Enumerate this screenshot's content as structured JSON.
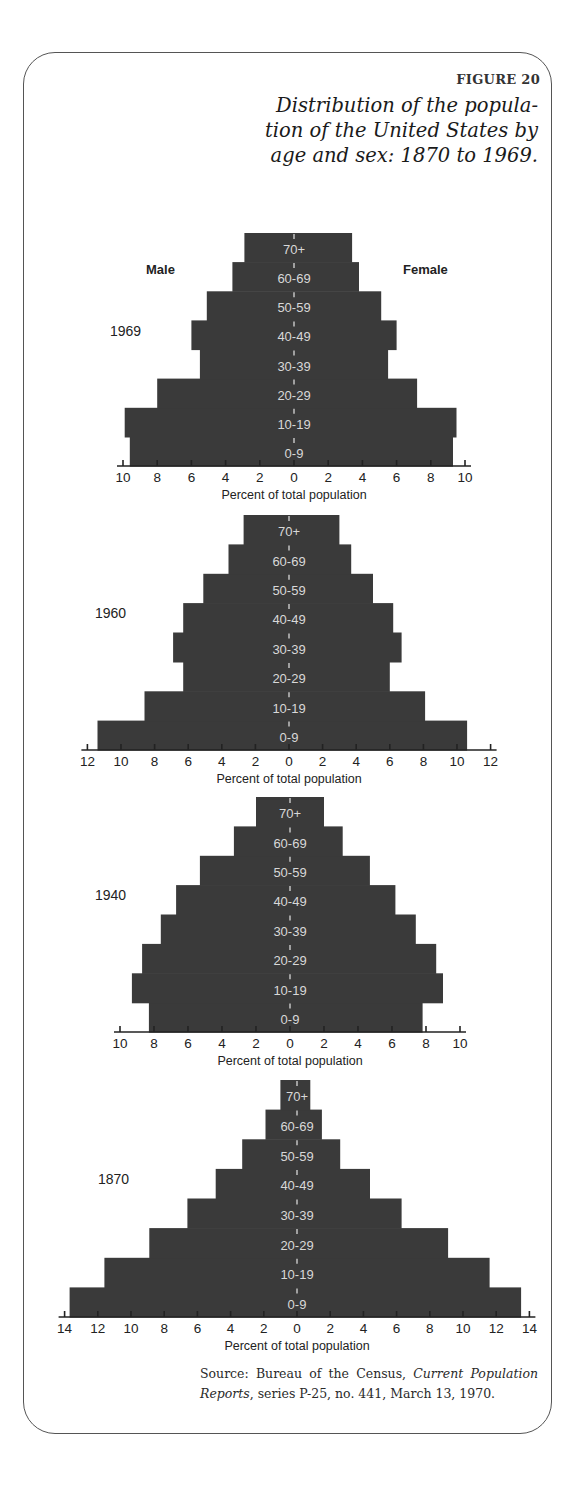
{
  "figure": {
    "label": "FIGURE 20",
    "title_lines": [
      "Distribution of the popula-",
      "tion of the United States by",
      "age and sex: 1870 to 1969."
    ],
    "legend": {
      "male": "Male",
      "female": "Female"
    },
    "source": {
      "prefix": "Source: Bureau of the Census, ",
      "italic": "Current Population Reports",
      "suffix": ", series P-25, no. 441, March 13, 1970."
    },
    "colors": {
      "bar": "#3a3a3a",
      "bar_label": "#d8d8d8",
      "axis": "#222222",
      "text": "#222222"
    }
  },
  "chart_data": [
    {
      "type": "bar",
      "subtype": "population-pyramid",
      "title": "1969",
      "xlabel": "Percent of total population",
      "categories": [
        "0-9",
        "10-19",
        "20-29",
        "30-39",
        "40-49",
        "50-59",
        "60-69",
        "70+"
      ],
      "xticks": [
        10,
        8,
        6,
        4,
        2,
        0,
        2,
        4,
        6,
        8,
        10
      ],
      "xlim": [
        -10,
        10
      ],
      "legend": [
        "Male",
        "Female"
      ],
      "series": [
        {
          "name": "Male",
          "values": [
            9.6,
            9.9,
            8.0,
            5.5,
            6.0,
            5.1,
            3.6,
            2.9
          ]
        },
        {
          "name": "Female",
          "values": [
            9.3,
            9.5,
            7.2,
            5.5,
            6.0,
            5.1,
            3.8,
            3.4
          ]
        }
      ],
      "layout": {
        "center_x": 294,
        "px_per_unit": 17.1,
        "top_y": 233,
        "axis_y": 466
      }
    },
    {
      "type": "bar",
      "subtype": "population-pyramid",
      "title": "1960",
      "xlabel": "Percent of total population",
      "categories": [
        "0-9",
        "10-19",
        "20-29",
        "30-39",
        "40-49",
        "50-59",
        "60-69",
        "70+"
      ],
      "xticks": [
        12,
        10,
        8,
        6,
        4,
        2,
        0,
        2,
        4,
        6,
        8,
        10,
        12
      ],
      "xlim": [
        -12,
        12
      ],
      "series": [
        {
          "name": "Male",
          "values": [
            11.4,
            8.6,
            6.3,
            6.9,
            6.3,
            5.1,
            3.6,
            2.7
          ]
        },
        {
          "name": "Female",
          "values": [
            10.6,
            8.1,
            6.0,
            6.7,
            6.2,
            5.0,
            3.7,
            3.0
          ]
        }
      ],
      "layout": {
        "center_x": 289,
        "px_per_unit": 16.8,
        "top_y": 515,
        "axis_y": 750
      }
    },
    {
      "type": "bar",
      "subtype": "population-pyramid",
      "title": "1940",
      "xlabel": "Percent of total population",
      "categories": [
        "0-9",
        "10-19",
        "20-29",
        "30-39",
        "40-49",
        "50-59",
        "60-69",
        "70+"
      ],
      "xticks": [
        10,
        8,
        6,
        4,
        2,
        0,
        2,
        4,
        6,
        8,
        10
      ],
      "xlim": [
        -10,
        10
      ],
      "series": [
        {
          "name": "Male",
          "values": [
            8.3,
            9.3,
            8.7,
            7.6,
            6.7,
            5.3,
            3.3,
            2.0
          ]
        },
        {
          "name": "Female",
          "values": [
            7.8,
            9.0,
            8.6,
            7.4,
            6.2,
            4.7,
            3.1,
            2.0
          ]
        }
      ],
      "layout": {
        "center_x": 290,
        "px_per_unit": 17.0,
        "top_y": 797,
        "axis_y": 1032
      }
    },
    {
      "type": "bar",
      "subtype": "population-pyramid",
      "title": "1870",
      "xlabel": "Percent of total population",
      "categories": [
        "0-9",
        "10-19",
        "20-29",
        "30-39",
        "40-49",
        "50-59",
        "60-69",
        "70+"
      ],
      "xticks": [
        14,
        12,
        10,
        8,
        6,
        4,
        2,
        0,
        2,
        4,
        6,
        8,
        10,
        12,
        14
      ],
      "xlim": [
        -14,
        14
      ],
      "series": [
        {
          "name": "Male",
          "values": [
            13.7,
            11.6,
            8.9,
            6.6,
            4.9,
            3.3,
            1.9,
            1.0
          ]
        },
        {
          "name": "Female",
          "values": [
            13.5,
            11.6,
            9.1,
            6.3,
            4.4,
            2.6,
            1.5,
            0.8
          ]
        }
      ],
      "layout": {
        "center_x": 297,
        "px_per_unit": 16.6,
        "top_y": 1080,
        "axis_y": 1317
      }
    }
  ]
}
